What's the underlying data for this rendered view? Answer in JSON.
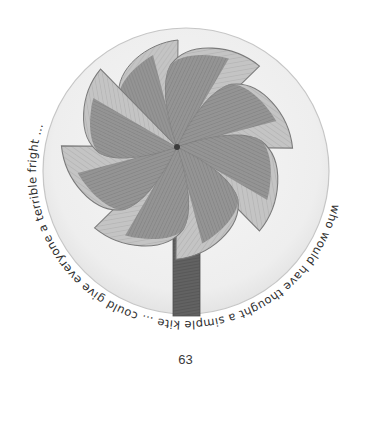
{
  "page": {
    "number": "63",
    "background": "#ffffff"
  },
  "illustration": {
    "subject": "pencil drawing of a pinwheel on a stick inside a circle",
    "circle": {
      "cx": 186,
      "cy": 171,
      "r": 143,
      "fill": "#f1f1f1",
      "stroke": "#c8c8c8"
    },
    "pinwheel": {
      "center": {
        "x": 177,
        "y": 147
      },
      "blade_count": 8,
      "light_color": "#bdbdbd",
      "dark_color": "#8a8a8a",
      "outline_color": "#6e6e6e",
      "stick_color": "#5c5c5c"
    },
    "caption_arc": {
      "text": "who would have thought a simple kite … could give everyone a terrible fright …",
      "color": "#2e2e2e"
    }
  }
}
